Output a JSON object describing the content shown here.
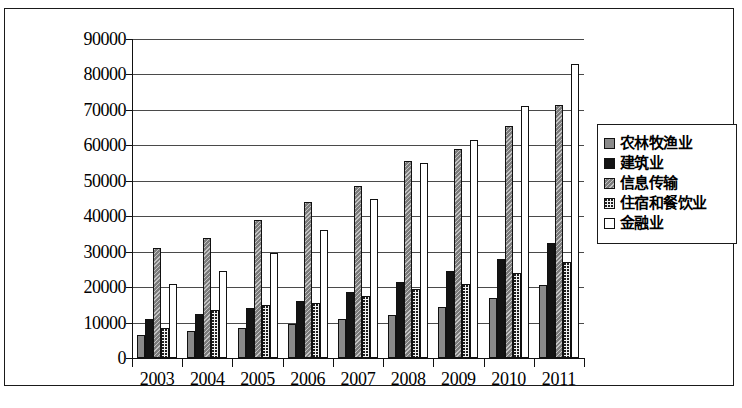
{
  "chart_data": {
    "type": "bar",
    "title": "",
    "subtitle": "",
    "xlabel": "",
    "ylabel": "",
    "categories": [
      "2003",
      "2004",
      "2005",
      "2006",
      "2007",
      "2008",
      "2009",
      "2010",
      "2011"
    ],
    "ylim": [
      0,
      90000
    ],
    "ytick_labels": [
      "90000",
      "80000",
      "70000",
      "60000",
      "50000",
      "40000",
      "30000",
      "20000",
      "10000",
      "0"
    ],
    "ytick_values": [
      90000,
      80000,
      70000,
      60000,
      50000,
      40000,
      30000,
      20000,
      10000,
      0
    ],
    "ytick_step": 10000,
    "grid": true,
    "legend_position": "right",
    "series": [
      {
        "name": "农林牧渔业",
        "swatch": "gray-solid",
        "color": "#8a8a8a",
        "values": [
          6500,
          7500,
          8500,
          9500,
          11000,
          12000,
          14500,
          17000,
          20500
        ]
      },
      {
        "name": "建筑业",
        "swatch": "black-solid",
        "color": "#141414",
        "values": [
          11000,
          12500,
          14000,
          16000,
          18500,
          21500,
          24500,
          28000,
          32500
        ]
      },
      {
        "name": "信息传输",
        "swatch": "gray-hatched",
        "color": "#7c7c7c",
        "values": [
          31000,
          34000,
          39000,
          44000,
          48500,
          55500,
          59000,
          65500,
          71500
        ]
      },
      {
        "name": "住宿和餐饮业",
        "swatch": "dotted-speckle",
        "color": "#f2f2f2",
        "values": [
          8500,
          13500,
          15000,
          15500,
          17500,
          19500,
          21000,
          24000,
          27000
        ]
      },
      {
        "name": "金融业",
        "swatch": "white-solid",
        "color": "#ffffff",
        "values": [
          21000,
          24500,
          29500,
          36000,
          45000,
          55000,
          61500,
          71000,
          83000
        ]
      }
    ]
  }
}
